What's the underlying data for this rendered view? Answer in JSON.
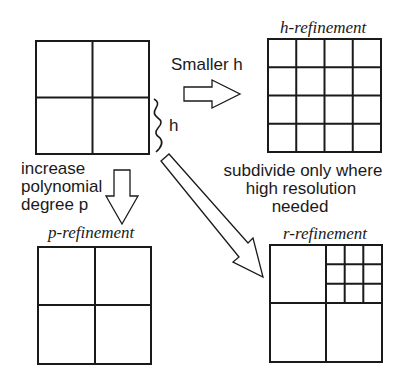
{
  "diagram": {
    "original_mesh": {
      "divisions": 2,
      "size_label": "h"
    },
    "h_refinement": {
      "label": "h-refinement",
      "arrow_label": "Smaller h",
      "divisions": 4
    },
    "p_refinement": {
      "label": "p-refinement",
      "arrow_label_lines": [
        "increase",
        "polynomial",
        "degree p"
      ],
      "divisions": 2
    },
    "r_refinement": {
      "label": "r-refinement",
      "arrow_label_lines": [
        "subdivide only where",
        "high resolution",
        "needed"
      ],
      "divisions": 2,
      "subdivided_quadrant": "top-right",
      "sub_divisions": 3
    },
    "colors": {
      "line": "#1a1a1a",
      "background": "#ffffff"
    }
  }
}
